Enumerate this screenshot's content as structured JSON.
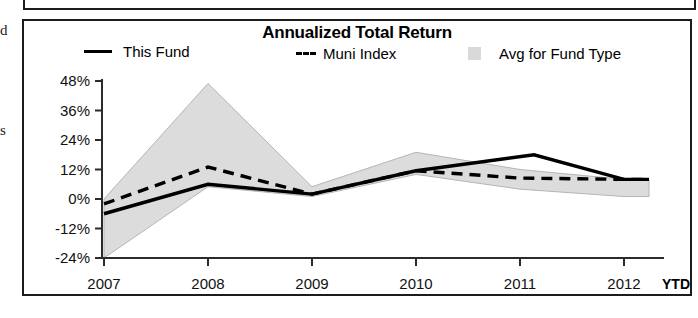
{
  "panel": {
    "margin_fragment_top": "d",
    "margin_fragment_mid": "s"
  },
  "chart": {
    "title": "Annualized Total Return",
    "legend": [
      {
        "label": "This Fund",
        "marker": "solid-line-swatch",
        "color": "#000000"
      },
      {
        "label": "Muni Index",
        "marker": "dashed-line-swatch",
        "color": "#000000"
      },
      {
        "label": "Avg for Fund Type",
        "marker": "area-swatch",
        "color": "#d9d9d9"
      }
    ],
    "x_axis_suffix": "YTD"
  },
  "chart_data": {
    "type": "line",
    "title": "Annualized Total Return",
    "xlabel": "",
    "ylabel": "",
    "categories": [
      "2007",
      "2008",
      "2009",
      "2010",
      "2011",
      "2012"
    ],
    "x_tick_labels": [
      "2007",
      "2008",
      "2009",
      "2010",
      "2011",
      "2012"
    ],
    "x_axis_note": "YTD",
    "y_tick_labels": [
      "48%",
      "36%",
      "24%",
      "12%",
      "0%",
      "-12%",
      "-24%"
    ],
    "y_ticks": [
      48,
      36,
      24,
      12,
      0,
      -12,
      -24
    ],
    "ylim": [
      -24,
      48
    ],
    "yunit": "%",
    "grid": false,
    "legend_position": "top",
    "series": [
      {
        "name": "This Fund",
        "style": "solid",
        "color": "#000000",
        "values": [
          -6,
          6,
          2,
          11.5,
          17,
          8
        ],
        "peak_note": "peaks near 18% just after 2011"
      },
      {
        "name": "Muni Index",
        "style": "dashed",
        "color": "#000000",
        "values": [
          -2,
          13,
          2,
          11.5,
          8.5,
          8
        ]
      },
      {
        "name": "Avg for Fund Type",
        "style": "band",
        "color": "#d9d9d9",
        "upper": [
          0,
          47,
          5,
          19,
          12,
          8
        ],
        "lower": [
          -24,
          5,
          1,
          10,
          4,
          1
        ]
      }
    ]
  }
}
